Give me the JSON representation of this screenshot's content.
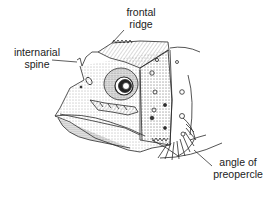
{
  "figure": {
    "colors": {
      "ink": "#2a2a2a",
      "stipple": "#6a6a6a",
      "background": "#ffffff"
    }
  },
  "labels": [
    {
      "id": "frontal-ridge",
      "lines": [
        "frontal",
        "ridge"
      ]
    },
    {
      "id": "internarial-spine",
      "lines": [
        "internarial",
        "spine"
      ]
    },
    {
      "id": "angle-of-preopercle",
      "lines": [
        "angle of",
        "preopercle"
      ]
    }
  ]
}
